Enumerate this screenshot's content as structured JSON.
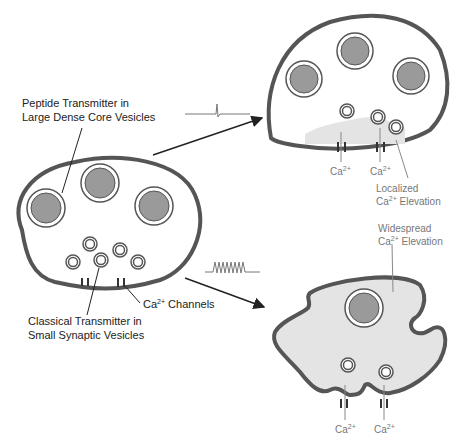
{
  "labels": {
    "peptide_line1": "Peptide Transmitter in",
    "peptide_line2": "Large Dense Core Vesicles",
    "classical_line1": "Classical Transmitter in",
    "classical_line2": "Small Synaptic Vesicles",
    "channels_ca": "Ca",
    "channels_sup": "2+",
    "channels_rest": " Channels",
    "localized_line1": "Localized",
    "localized_ca": "Ca",
    "localized_sup": "2+",
    "localized_rest": " Elevation",
    "widespread_line1": "Widespread",
    "widespread_ca": "Ca",
    "widespread_sup": "2+",
    "widespread_rest": " Elevation",
    "ca_ion": "Ca",
    "ca_sup": "2+"
  },
  "colors": {
    "membrane": "#555555",
    "dense_core": "#9a9a9a",
    "cytosol_elevated": "#e4e4e4",
    "text": "#222222",
    "text_gray": "#777777"
  },
  "stimuli": {
    "single_spike": "single action potential",
    "spike_train": "high-frequency train"
  }
}
